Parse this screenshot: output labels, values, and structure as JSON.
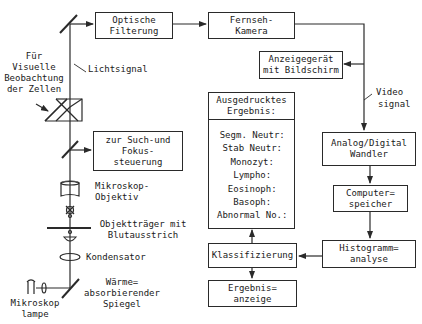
{
  "diagram": {
    "type": "block-diagram",
    "boxes": {
      "optical_filter": {
        "lines": [
          "Optische",
          "Filterung"
        ]
      },
      "tv_camera": {
        "lines": [
          "Fernseh-",
          "Kamera"
        ]
      },
      "display": {
        "lines": [
          "Anzeigegerät",
          "mit Bildschirm"
        ]
      },
      "adc": {
        "lines": [
          "Analog/Digital",
          "Wandler"
        ]
      },
      "memory": {
        "lines": [
          "Computer=",
          "speicher"
        ]
      },
      "histogram": {
        "lines": [
          "Histogramm=",
          "analyse"
        ]
      },
      "classify": {
        "lines": [
          "Klassifizierung"
        ]
      },
      "result_display": {
        "lines": [
          "Ergebnis=",
          "anzeige"
        ]
      },
      "focus": {
        "lines": [
          "zur Such-und",
          "Fokus-",
          "steuerung"
        ]
      },
      "printed_result": {
        "title_lines": [
          "Ausgedrucktes",
          "Ergebnis:"
        ],
        "items": [
          "Segm. Neutr:",
          "Stab Neutr:",
          "Monozyt:",
          "Lympho:",
          "Eosinoph:",
          "Basoph:",
          "Abnormal No.:"
        ]
      }
    },
    "labels": {
      "visual": [
        "Für",
        "Visuelle",
        "Beobachtung",
        "der Zellen"
      ],
      "light_signal": "Lichtsignal",
      "video_signal": [
        "Video",
        "signal"
      ],
      "objective": [
        "Mikroskop-",
        "Objektiv"
      ],
      "slide": [
        "Objektträger mit",
        "Blutausstrich"
      ],
      "condenser": "Kondensator",
      "heat_mirror": [
        "Wärme=",
        "absorbierender",
        "Spiegel"
      ],
      "lamp": [
        "Mikroskop",
        "lampe"
      ]
    },
    "colors": {
      "line": "#2a2a2a",
      "background": "#ffffff"
    }
  }
}
